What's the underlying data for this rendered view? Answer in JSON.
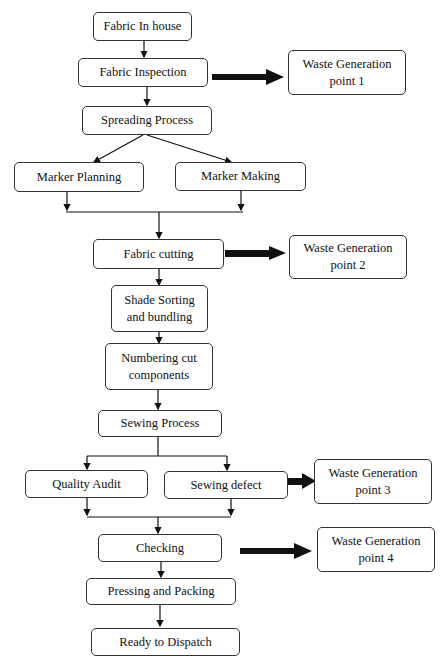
{
  "diagram": {
    "nodes": {
      "fabric_in_house": "Fabric In house",
      "fabric_inspection": "Fabric Inspection",
      "spreading_process": "Spreading Process",
      "marker_planning": "Marker Planning",
      "marker_making": "Marker Making",
      "fabric_cutting": "Fabric cutting",
      "shade_sorting_l1": "Shade Sorting",
      "shade_sorting_l2": "and bundling",
      "numbering_l1": "Numbering cut",
      "numbering_l2": "components",
      "sewing_process": "Sewing Process",
      "quality_audit": "Quality Audit",
      "sewing_defect": "Sewing defect",
      "checking": "Checking",
      "pressing_packing": "Pressing and Packing",
      "ready_dispatch": "Ready to Dispatch"
    },
    "waste_points": [
      {
        "l1": "Waste Generation",
        "l2": "point 1"
      },
      {
        "l1": "Waste Generation",
        "l2": "point 2"
      },
      {
        "l1": "Waste Generation",
        "l2": "point 3"
      },
      {
        "l1": "Waste Generation",
        "l2": "point 4"
      }
    ],
    "edges": [
      [
        "Fabric In house",
        "Fabric Inspection"
      ],
      [
        "Fabric Inspection",
        "Spreading Process"
      ],
      [
        "Fabric Inspection",
        "Waste Generation point 1"
      ],
      [
        "Spreading Process",
        "Marker Planning"
      ],
      [
        "Spreading Process",
        "Marker Making"
      ],
      [
        "Marker Planning",
        "Fabric cutting"
      ],
      [
        "Marker Making",
        "Fabric cutting"
      ],
      [
        "Fabric cutting",
        "Waste Generation point 2"
      ],
      [
        "Fabric cutting",
        "Shade Sorting and bundling"
      ],
      [
        "Shade Sorting and bundling",
        "Numbering cut components"
      ],
      [
        "Numbering cut components",
        "Sewing Process"
      ],
      [
        "Sewing Process",
        "Quality Audit"
      ],
      [
        "Sewing Process",
        "Sewing defect"
      ],
      [
        "Sewing defect",
        "Waste Generation point 3"
      ],
      [
        "Quality Audit",
        "Checking"
      ],
      [
        "Sewing defect",
        "Checking"
      ],
      [
        "Checking",
        "Waste Generation point 4"
      ],
      [
        "Checking",
        "Pressing and Packing"
      ],
      [
        "Pressing and Packing",
        "Ready to Dispatch"
      ]
    ]
  }
}
